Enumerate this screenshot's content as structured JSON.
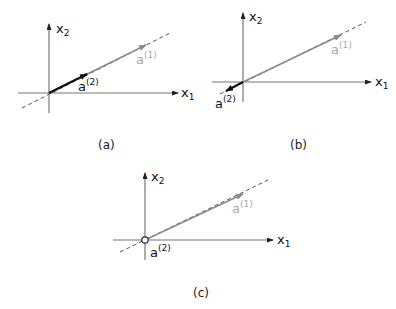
{
  "colors": {
    "axis": "#777777",
    "vector_a1": "#8a8a8a",
    "vector_a1_label": "#a8a8a8",
    "vector_a2": "#111111",
    "dashed": "#555555"
  },
  "panels": [
    {
      "caption": "(a)",
      "x_axis_label": "x",
      "x_axis_sub": "1",
      "y_axis_label": "x",
      "y_axis_sub": "2",
      "a1_label": "a",
      "a1_sup": "(1)",
      "a2_label": "a",
      "a2_sup": "(2)",
      "a2_description": "same direction as a(1), shorter"
    },
    {
      "caption": "(b)",
      "x_axis_label": "x",
      "x_axis_sub": "1",
      "y_axis_label": "x",
      "y_axis_sub": "2",
      "a1_label": "a",
      "a1_sup": "(1)",
      "a2_label": "a",
      "a2_sup": "(2)",
      "a2_description": "opposite direction to a(1)"
    },
    {
      "caption": "(c)",
      "x_axis_label": "x",
      "x_axis_sub": "1",
      "y_axis_label": "x",
      "y_axis_sub": "2",
      "a1_label": "a",
      "a1_sup": "(1)",
      "a2_label": "a",
      "a2_sup": "(2)",
      "a2_description": "zero vector at origin"
    }
  ]
}
